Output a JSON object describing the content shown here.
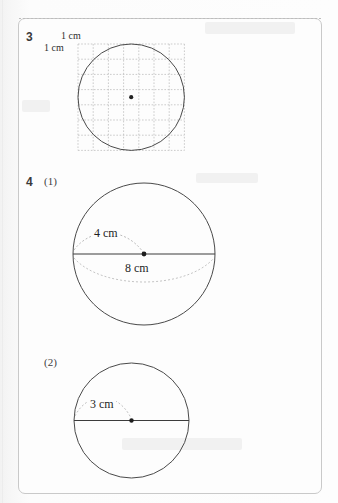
{
  "page": {
    "type": "math-worksheet-scan",
    "width": 338,
    "height": 503,
    "background_color": "#fbfbfb",
    "box_border_color": "#c9c9c9",
    "ink_color": "#3a3a3a",
    "grid_color": "#b9b9b9"
  },
  "problems": [
    {
      "number": "3",
      "labels": {
        "top_cm": "1 cm",
        "left_cm": "1 cm"
      },
      "figure": {
        "kind": "circle-on-grid",
        "grid_cells_x": 7,
        "grid_cells_y": 7,
        "circle_center_marked": true
      }
    },
    {
      "number": "4",
      "parts": [
        {
          "label": "(1)",
          "figure": {
            "kind": "circle-with-radius-and-diameter",
            "radius_label": "4 cm",
            "diameter_label": "8 cm",
            "center_marked": true,
            "diameter_line": true
          }
        },
        {
          "label": "(2)",
          "figure": {
            "kind": "circle-with-radius",
            "radius_label": "3 cm",
            "center_marked": true,
            "diameter_line": true
          }
        }
      ]
    }
  ],
  "icons": {
    "center_dot": "center-point-dot"
  }
}
